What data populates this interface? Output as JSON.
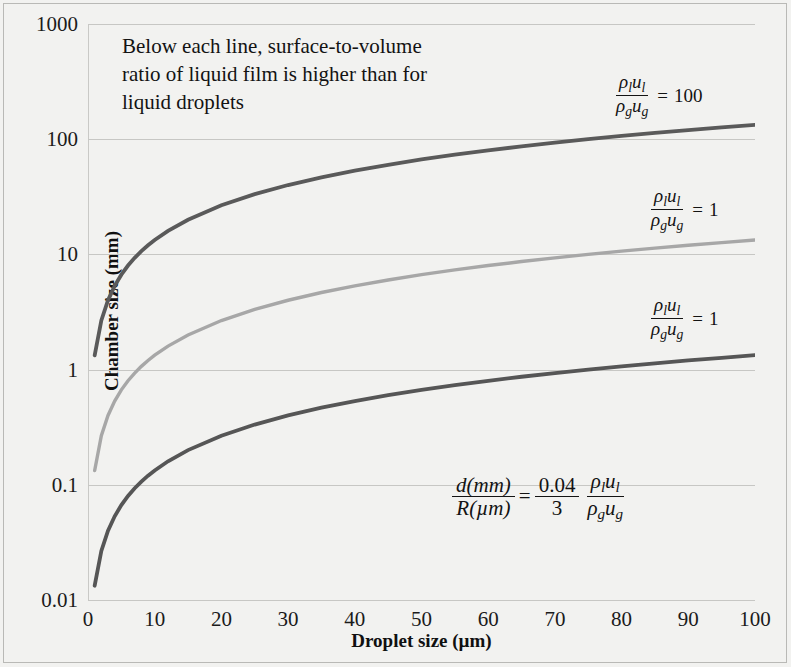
{
  "chart_data": {
    "type": "line",
    "title": "",
    "xlabel": "Droplet size (µm)",
    "ylabel": "Chamber size (mm)",
    "xlim": [
      0,
      100
    ],
    "ylim": [
      0.01,
      1000
    ],
    "yscale": "log",
    "xscale": "linear",
    "grid": true,
    "legend_position": "inline-right",
    "xticks": [
      "0",
      "10",
      "20",
      "30",
      "40",
      "50",
      "60",
      "70",
      "80",
      "90",
      "100"
    ],
    "xtick_values": [
      0,
      10,
      20,
      30,
      40,
      50,
      60,
      70,
      80,
      90,
      100
    ],
    "yticks": [
      "0.01",
      "0.1",
      "1",
      "10",
      "100",
      "1000"
    ],
    "ytick_values": [
      0.01,
      0.1,
      1,
      10,
      100,
      1000
    ],
    "annotation": "Below each line, surface-to-volume ratio of liquid film is higher than for liquid droplets",
    "equation": {
      "lhs_num": "d(mm)",
      "lhs_den": "R(µm)",
      "equals": "=",
      "coef_num": "0.04",
      "coef_den": "3",
      "ratio_num_rho": "ρ",
      "ratio_num_rho_sub": "l",
      "ratio_num_u": "u",
      "ratio_num_u_sub": "l",
      "ratio_den_rho": "ρ",
      "ratio_den_rho_sub": "g",
      "ratio_den_u": "u",
      "ratio_den_u_sub": "g"
    },
    "series": [
      {
        "name": "ratio-100",
        "label_value": "100",
        "color": "#5a5a5a",
        "x": [
          1,
          2,
          3,
          4,
          5,
          6,
          7,
          8,
          9,
          10,
          12,
          15,
          20,
          25,
          30,
          35,
          40,
          45,
          50,
          55,
          60,
          65,
          70,
          75,
          80,
          85,
          90,
          95,
          100
        ],
        "values": [
          1.33,
          2.67,
          4.0,
          5.33,
          6.67,
          8.0,
          9.33,
          10.67,
          12.0,
          13.33,
          16.0,
          20.0,
          26.67,
          33.33,
          40.0,
          46.67,
          53.33,
          60.0,
          66.67,
          73.33,
          80.0,
          86.67,
          93.33,
          100.0,
          106.67,
          113.33,
          120.0,
          126.67,
          133.33
        ]
      },
      {
        "name": "ratio-10",
        "label_value": "1",
        "color": "#a7a7a7",
        "x": [
          1,
          2,
          3,
          4,
          5,
          6,
          7,
          8,
          9,
          10,
          12,
          15,
          20,
          25,
          30,
          35,
          40,
          45,
          50,
          55,
          60,
          65,
          70,
          75,
          80,
          85,
          90,
          95,
          100
        ],
        "values": [
          0.133,
          0.267,
          0.4,
          0.533,
          0.667,
          0.8,
          0.933,
          1.067,
          1.2,
          1.333,
          1.6,
          2.0,
          2.667,
          3.333,
          4.0,
          4.667,
          5.333,
          6.0,
          6.667,
          7.333,
          8.0,
          8.667,
          9.333,
          10.0,
          10.667,
          11.333,
          12.0,
          12.667,
          13.333
        ]
      },
      {
        "name": "ratio-1",
        "label_value": "1",
        "color": "#565656",
        "x": [
          1,
          2,
          3,
          4,
          5,
          6,
          7,
          8,
          9,
          10,
          12,
          15,
          20,
          25,
          30,
          35,
          40,
          45,
          50,
          55,
          60,
          65,
          70,
          75,
          80,
          85,
          90,
          95,
          100
        ],
        "values": [
          0.0133,
          0.0267,
          0.04,
          0.0533,
          0.0667,
          0.08,
          0.0933,
          0.1067,
          0.12,
          0.1333,
          0.16,
          0.2,
          0.2667,
          0.3333,
          0.4,
          0.4667,
          0.5333,
          0.6,
          0.6667,
          0.7333,
          0.8,
          0.8667,
          0.9333,
          1.0,
          1.0667,
          1.1333,
          1.2,
          1.2667,
          1.3333
        ]
      }
    ],
    "series_labels": [
      {
        "name": "series-label-100",
        "rho_num": "ρ",
        "rho_num_sub": "l",
        "u_num": "u",
        "u_num_sub": "l",
        "rho_den": "ρ",
        "rho_den_sub": "g",
        "u_den": "u",
        "u_den_sub": "g",
        "equals": "=",
        "value": "100"
      },
      {
        "name": "series-label-10",
        "rho_num": "ρ",
        "rho_num_sub": "l",
        "u_num": "u",
        "u_num_sub": "l",
        "rho_den": "ρ",
        "rho_den_sub": "g",
        "u_den": "u",
        "u_den_sub": "g",
        "equals": "=",
        "value": "1"
      },
      {
        "name": "series-label-1",
        "rho_num": "ρ",
        "rho_num_sub": "l",
        "u_num": "u",
        "u_num_sub": "l",
        "rho_den": "ρ",
        "rho_den_sub": "g",
        "u_den": "u",
        "u_den_sub": "g",
        "equals": "=",
        "value": "1"
      }
    ],
    "colors": {
      "background": "#f2f2f0",
      "gridline": "#c7c7c4",
      "text": "#131313",
      "border": "#b9b9b6"
    }
  }
}
